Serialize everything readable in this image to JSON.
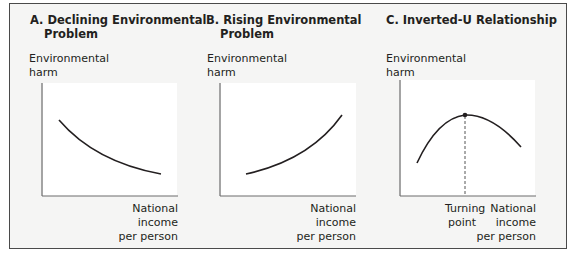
{
  "figure": {
    "panels": [
      {
        "id": "A",
        "title_line1": "A. Declining Environmental",
        "title_line2": "Problem",
        "y_label_line1": "Environmental",
        "y_label_line2": "harm",
        "x_label_line1": "National",
        "x_label_line2": "income",
        "x_label_line3": "per person",
        "curve": "decreasing"
      },
      {
        "id": "B",
        "title_line1": "B. Rising Environmental",
        "title_line2": "Problem",
        "y_label_line1": "Environmental",
        "y_label_line2": "harm",
        "x_label_line1": "National",
        "x_label_line2": "income",
        "x_label_line3": "per person",
        "curve": "increasing"
      },
      {
        "id": "C",
        "title_line1": "C. Inverted-U Relationship",
        "y_label_line1": "Environmental",
        "y_label_line2": "harm",
        "x_label_line1": "National",
        "x_label_line2": "income",
        "x_label_line3": "per person",
        "turning_label_line1": "Turning",
        "turning_label_line2": "point",
        "curve": "inverted-u"
      }
    ],
    "colors": {
      "background": "#f5f5f4",
      "plot_area": "#ffffff",
      "line": "#231f20",
      "axis": "#6d6d6d"
    }
  }
}
